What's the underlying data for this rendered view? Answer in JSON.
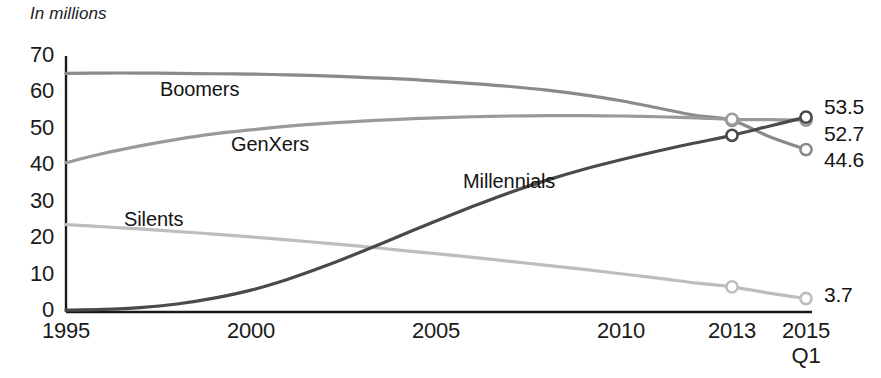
{
  "chart_data": {
    "type": "line",
    "title": "",
    "subtitle": "In millions",
    "xlabel": "",
    "ylabel": "",
    "unit_note": "In millions",
    "grid": false,
    "legend_position": "inline-labels",
    "xlim": [
      1995,
      2015
    ],
    "ylim": [
      0,
      70
    ],
    "ytick_labels": [
      "70",
      "60",
      "50",
      "40",
      "30",
      "20",
      "10",
      "0"
    ],
    "ytick_values": [
      70,
      60,
      50,
      40,
      30,
      20,
      10,
      0
    ],
    "xtick_labels": [
      "1995",
      "2000",
      "2005",
      "2010",
      "2013",
      "2015"
    ],
    "xtick_sublabels": [
      "",
      "",
      "",
      "",
      "",
      "Q1"
    ],
    "xtick_values": [
      1995,
      2000,
      2005,
      2010,
      2013,
      2015
    ],
    "x": [
      1995,
      1996,
      1997,
      1998,
      1999,
      2000,
      2001,
      2002,
      2003,
      2004,
      2005,
      2006,
      2007,
      2008,
      2009,
      2010,
      2011,
      2012,
      2013,
      2014,
      2015
    ],
    "series": [
      {
        "name": "Boomers",
        "color": "#8a8a8a",
        "label_x": 160,
        "label_y": 78,
        "end_value": 44.6,
        "end_label": "44.6",
        "marker_years": [
          2013,
          2015
        ],
        "values": [
          65.5,
          65.6,
          65.6,
          65.5,
          65.4,
          65.3,
          65.1,
          64.8,
          64.4,
          64.0,
          63.4,
          62.7,
          61.9,
          60.9,
          59.6,
          58.0,
          56.0,
          54.0,
          52.6,
          48.2,
          44.6
        ]
      },
      {
        "name": "GenXers",
        "color": "#9a9a9a",
        "label_x": 231,
        "label_y": 133,
        "end_value": 52.7,
        "end_label": "52.7",
        "marker_years": [
          2013,
          2015
        ],
        "values": [
          41.0,
          43.5,
          45.6,
          47.4,
          48.9,
          50.0,
          51.0,
          51.8,
          52.4,
          52.9,
          53.3,
          53.6,
          53.8,
          53.9,
          53.9,
          53.8,
          53.6,
          53.3,
          52.9,
          52.8,
          52.7
        ]
      },
      {
        "name": "Millennials",
        "color": "#4a4a4a",
        "label_x": 463,
        "label_y": 170,
        "end_value": 53.5,
        "end_label": "53.5",
        "marker_years": [
          2013,
          2015
        ],
        "values": [
          0.5,
          0.7,
          1.2,
          2.2,
          3.8,
          6.0,
          9.0,
          12.6,
          16.6,
          20.8,
          25.0,
          29.0,
          32.8,
          36.2,
          39.2,
          41.8,
          44.2,
          46.4,
          48.5,
          51.0,
          53.5
        ]
      },
      {
        "name": "Silents",
        "color": "#bdbdbd",
        "label_x": 124,
        "label_y": 208,
        "end_value": 3.7,
        "end_label": "3.7",
        "marker_years": [
          2013,
          2015
        ],
        "values": [
          24.0,
          23.4,
          22.8,
          22.1,
          21.4,
          20.6,
          19.8,
          18.9,
          18.0,
          17.0,
          16.0,
          15.0,
          13.9,
          12.8,
          11.7,
          10.5,
          9.3,
          8.0,
          6.9,
          5.2,
          3.7
        ]
      }
    ],
    "end_labels": [
      {
        "text": "53.5",
        "x": 824,
        "y": 95
      },
      {
        "text": "52.7",
        "x": 824,
        "y": 122
      },
      {
        "text": "44.6",
        "x": 824,
        "y": 148
      },
      {
        "text": "3.7",
        "x": 824,
        "y": 283
      }
    ],
    "axis_color": "#1a1a1a",
    "background": "#ffffff"
  }
}
